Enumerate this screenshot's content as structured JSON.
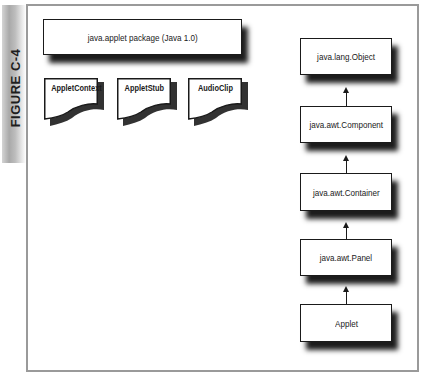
{
  "figure": {
    "label": "FIGURE C-4"
  },
  "package_box": {
    "label": "java.applet package (Java 1.0)"
  },
  "interfaces": [
    {
      "label": "AppletContext"
    },
    {
      "label": "AppletStub"
    },
    {
      "label": "AudioClip"
    }
  ],
  "hierarchy": [
    {
      "label": "java.lang.Object"
    },
    {
      "label": "java.awt.Component"
    },
    {
      "label": "java.awt.Container"
    },
    {
      "label": "java.awt.Panel"
    },
    {
      "label": "Applet"
    }
  ],
  "colors": {
    "frame_border": "#9a9a9a",
    "box_border": "#1a1a1a",
    "shadow": "#1c1c1c",
    "tab_gray": "#a9a9a9"
  }
}
